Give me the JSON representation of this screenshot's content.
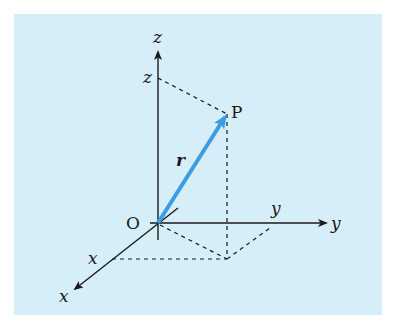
{
  "figure": {
    "background_color": "#d5eef7",
    "axis_color": "#1a1a1a",
    "vector_color": "#3d9de0",
    "labels": {
      "origin": "O",
      "point": "P",
      "vector": "r",
      "x_axis": "x",
      "y_axis": "y",
      "z_axis": "z",
      "x_coord": "x",
      "y_coord": "y",
      "z_coord": "z"
    }
  }
}
